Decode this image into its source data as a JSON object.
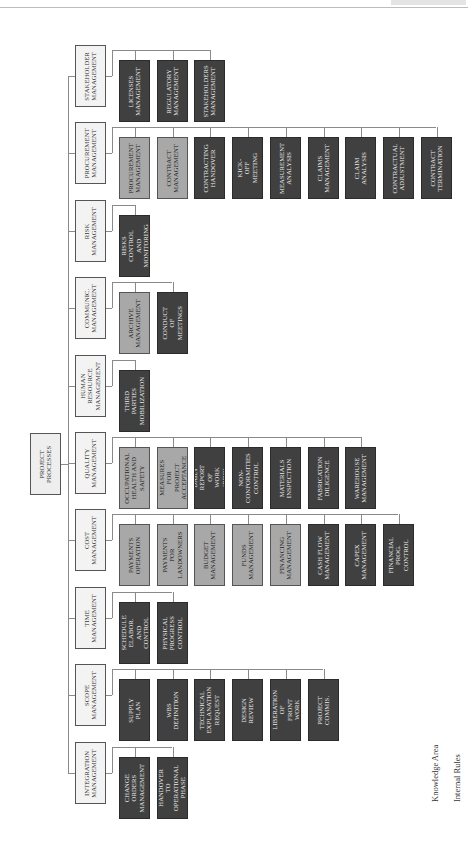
{
  "diagram": {
    "root": {
      "label": "PROJECT\nPROCESSES"
    },
    "colors": {
      "knowledge_area": "#f3f3f3",
      "internal_rules": "#a8a8a8",
      "dark_process": "#404040",
      "connector": "#8a8a8a"
    },
    "knowledge_areas": [
      {
        "label": "STAKEHOLDER\nMANAGEMENT",
        "children": [
          {
            "label": "LICENSES\nMANAGEMENT",
            "type": "dark"
          },
          {
            "label": "REGULATORY\nMANAGEMENT",
            "type": "dark"
          },
          {
            "label": "STAKEHOLDERS\nMANAGEMENT",
            "type": "dark"
          }
        ]
      },
      {
        "label": "PROCUREMENT\nMANAGEMENT",
        "children": [
          {
            "label": "PROCUREMENT\nMANAGEMENT",
            "type": "rule"
          },
          {
            "label": "CONTRACT\nMANAGEMENT",
            "type": "rule"
          },
          {
            "label": "CONTRACTING\nHANDOVER",
            "type": "dark"
          },
          {
            "label": "KICK-OFF\nMEETING",
            "type": "dark"
          },
          {
            "label": "MEASUREMENT\nANALYSIS",
            "type": "dark"
          },
          {
            "label": "CLAIMS\nMANAGEMENT",
            "type": "dark"
          },
          {
            "label": "CLAIM\nANALYSIS",
            "type": "dark"
          },
          {
            "label": "CONTRACTUAL\nADJUSTMENT",
            "type": "dark"
          },
          {
            "label": "CONTRACT\nTERMINATION",
            "type": "dark"
          }
        ]
      },
      {
        "label": "RISK\nMANAGEMENT",
        "children": [
          {
            "label": "RISKS\nCONTROL AND\nMONITORING",
            "type": "dark"
          }
        ]
      },
      {
        "label": "COMMUNIC.\nMANAGEMENT",
        "children": [
          {
            "label": "ARCHIVE\nMANAGEMENT",
            "type": "rule"
          },
          {
            "label": "CONDUCT OF\nMEETINGS",
            "type": "dark"
          }
        ]
      },
      {
        "label": "HUMAN\nRESOURCE\nMANAGEMENT",
        "children": [
          {
            "label": "THIRD PARTIES\nMOBILIZATION",
            "type": "dark"
          }
        ]
      },
      {
        "label": "QUALITY\nMANAGEMENT",
        "children": [
          {
            "label": "OCCUPATIONAL\nHEALTH AND\nSAFETY",
            "type": "rule"
          },
          {
            "label": "MEASURES FOR\nPROJECT\nACCEPTANCE",
            "type": "rule"
          },
          {
            "label": "DAILY REPORT\nOF\nWORK (RDO)",
            "type": "dark"
          },
          {
            "label": "NON-\nCONFORMITIES\nCONTROL",
            "type": "dark"
          },
          {
            "label": "MATERIALS\nINSPECTION",
            "type": "dark"
          },
          {
            "label": "FABRICATION\nDILIGENCE",
            "type": "dark"
          },
          {
            "label": "WAREHOUSE\nMANAGEMENT",
            "type": "dark"
          }
        ]
      },
      {
        "label": "COST\nMANAGEMENT",
        "children": [
          {
            "label": "PAYMENTS\nOPERATION",
            "type": "rule"
          },
          {
            "label": "PAYMENTS FOR\nLANDOWNERS",
            "type": "rule"
          },
          {
            "label": "BUDGET\nMANAGEMENT",
            "type": "rule"
          },
          {
            "label": "FUNDS\nMANAGEMENT",
            "type": "rule"
          },
          {
            "label": "FINANCING\nMANAGEMENT",
            "type": "rule"
          },
          {
            "label": "CASH FLOW\nMANAGEMENT",
            "type": "dark"
          },
          {
            "label": "CAPEX\nMANAGEMENT",
            "type": "dark"
          },
          {
            "label": "FINANCIAL\nPROG.\nCONTROL",
            "type": "dark"
          }
        ]
      },
      {
        "label": "TIME\nMANAGEMENT",
        "children": [
          {
            "label": "SCHEDULE\nELABOR. AND\nCONTROL",
            "type": "dark"
          },
          {
            "label": "PHYSICAL\nPROGRESS\nCONTROL",
            "type": "dark"
          }
        ]
      },
      {
        "label": "SCOPE\nMANAGEMENT",
        "children": [
          {
            "label": "SUPPLY\nPLAN",
            "type": "dark"
          },
          {
            "label": "WBS\nDEFINITION",
            "type": "dark"
          },
          {
            "label": "TECHNICAL\nEXPLANATION\nREQUEST",
            "type": "dark"
          },
          {
            "label": "DESIGN\nREVIEW",
            "type": "dark"
          },
          {
            "label": "LIBERATION OF\nFRONT WORK",
            "type": "dark"
          },
          {
            "label": "PROJECT\nCOMMIS.",
            "type": "dark"
          }
        ]
      },
      {
        "label": "INTEGRATION\nMANAGEMENT",
        "children": [
          {
            "label": "CHANGE\nORDERS\nMANAGEMENT",
            "type": "dark"
          },
          {
            "label": "HANDOVER TO\nOPERATIONAL\nPHASE",
            "type": "dark"
          }
        ]
      }
    ],
    "legend": [
      {
        "label": "Knowledge Area",
        "swatch": "#f3f3f3"
      },
      {
        "label": "Internal Rules",
        "swatch": "#a8a8a8"
      }
    ]
  }
}
